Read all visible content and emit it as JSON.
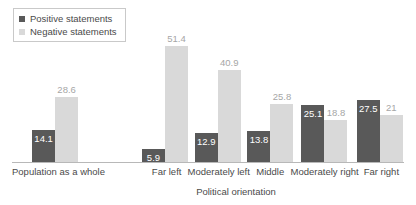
{
  "legend": {
    "position": "top-left",
    "entries": [
      {
        "label": "Positive statements",
        "color": "#595959",
        "icon": "square-swatch"
      },
      {
        "label": "Negative statements",
        "color": "#d9d9d9",
        "icon": "square-swatch"
      }
    ]
  },
  "axis": {
    "xlabel": "Political orientation"
  },
  "colors": {
    "positive": "#595959",
    "negative": "#d9d9d9",
    "axis_line": "#b8b8b8",
    "text": "#4a4a4a",
    "negative_label": "#a6a6a6",
    "positive_label": "#ffffff",
    "background": "#ffffff"
  },
  "chart_data": {
    "type": "bar",
    "title": "",
    "subtitle": "",
    "xlabel": "Political orientation",
    "ylabel": "",
    "ylim": [
      0,
      55
    ],
    "grid": false,
    "legend_position": "top-left",
    "grouping": "grouped",
    "categories": [
      "Population as a whole",
      "Far left",
      "Moderately left",
      "Middle",
      "Moderately right",
      "Far right"
    ],
    "series": [
      {
        "name": "Positive statements",
        "color": "#595959",
        "values": [
          14.1,
          5.9,
          12.9,
          13.8,
          25.1,
          27.5
        ],
        "labels": [
          "14.1",
          "5.9",
          "12.9",
          "13.8",
          "25.1",
          "27.5"
        ]
      },
      {
        "name": "Negative statements",
        "color": "#d9d9d9",
        "values": [
          28.6,
          51.4,
          40.9,
          25.8,
          18.8,
          21.0
        ],
        "labels": [
          "28.6",
          "51.4",
          "40.9",
          "25.8",
          "18.8",
          "21"
        ]
      }
    ]
  }
}
